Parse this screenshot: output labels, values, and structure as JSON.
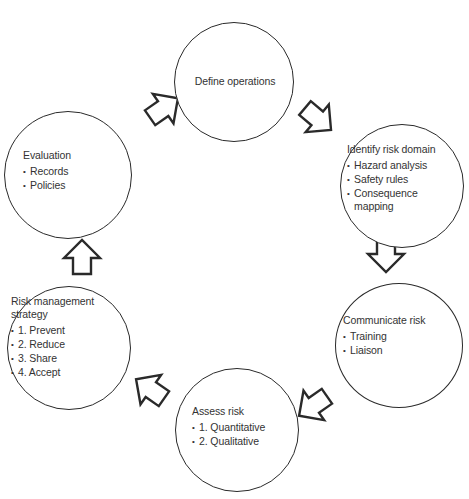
{
  "diagram": {
    "type": "cycle",
    "stroke_color": "#2a2a2a",
    "text_color": "#333333",
    "background": "#ffffff",
    "nodes": [
      {
        "id": "define-operations",
        "title": "Define operations",
        "items": []
      },
      {
        "id": "identify-risk-domain",
        "title": "Identify risk domain",
        "items": [
          "Hazard analysis",
          "Safety rules",
          "Consequence mapping"
        ]
      },
      {
        "id": "communicate-risk",
        "title": "Communicate risk",
        "items": [
          "Training",
          "Liaison"
        ]
      },
      {
        "id": "assess-risk",
        "title": "Assess risk",
        "items": [
          "1. Quantitative",
          "2. Qualitative"
        ]
      },
      {
        "id": "risk-management-strategy",
        "title": "Risk management strategy",
        "items": [
          "1. Prevent",
          "2. Reduce",
          "3. Share",
          "4. Accept"
        ]
      },
      {
        "id": "evaluation",
        "title": "Evaluation",
        "items": [
          "Records",
          "Policies"
        ]
      }
    ],
    "edges": [
      {
        "from": "define-operations",
        "to": "identify-risk-domain",
        "direction": "down-right"
      },
      {
        "from": "identify-risk-domain",
        "to": "communicate-risk",
        "direction": "down"
      },
      {
        "from": "communicate-risk",
        "to": "assess-risk",
        "direction": "down-left"
      },
      {
        "from": "assess-risk",
        "to": "risk-management-strategy",
        "direction": "up-left"
      },
      {
        "from": "risk-management-strategy",
        "to": "evaluation",
        "direction": "up"
      },
      {
        "from": "evaluation",
        "to": "define-operations",
        "direction": "up-right"
      }
    ]
  }
}
